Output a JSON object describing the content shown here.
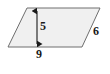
{
  "figure": {
    "kind": "parallelogram-with-dimensions",
    "canvas": {
      "width": 110,
      "height": 74,
      "background": "#ffffff"
    },
    "shape": {
      "name": "parallelogram",
      "fill": "#f0f0f0",
      "stroke": "#6e6e6e",
      "stroke_width": 1,
      "vertices": [
        {
          "name": "bottom-left",
          "x": 8,
          "y": 47
        },
        {
          "name": "bottom-right",
          "x": 82,
          "y": 47
        },
        {
          "name": "top-right",
          "x": 100,
          "y": 8
        },
        {
          "name": "top-left",
          "x": 27,
          "y": 8
        }
      ]
    },
    "height_arrow": {
      "name": "height-double-arrow",
      "x": 37,
      "y_top": 8,
      "y_bottom": 47,
      "stroke": "#1a1a1a",
      "stroke_width": 1,
      "double_headed": true
    },
    "labels": {
      "height": {
        "text": "5",
        "meaning": "height",
        "x": 40,
        "y": 20
      },
      "base": {
        "text": "9",
        "meaning": "base",
        "x": 36,
        "y": 48
      },
      "side": {
        "text": "6",
        "meaning": "slant-side",
        "x": 93,
        "y": 25
      }
    }
  },
  "chart_data": {
    "type": "diagram",
    "title": "",
    "shape": "parallelogram",
    "measurements": [
      {
        "label": "5",
        "value": 5,
        "role": "height"
      },
      {
        "label": "9",
        "value": 9,
        "role": "base"
      },
      {
        "label": "6",
        "value": 6,
        "role": "side"
      }
    ]
  }
}
